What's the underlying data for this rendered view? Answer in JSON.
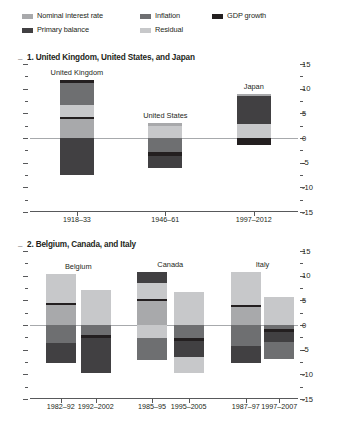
{
  "legend": {
    "items": [
      {
        "label": "Nominal interest rate",
        "color": "#a8a9ab",
        "key": "nominal_interest_rate"
      },
      {
        "label": "Inflation",
        "color": "#6e6f71",
        "key": "inflation"
      },
      {
        "label": "GDP growth",
        "color": "#231f20",
        "key": "gdp_growth"
      },
      {
        "label": "Primary balance",
        "color": "#414042",
        "key": "primary_balance"
      },
      {
        "label": "Residual",
        "color": "#c7c8ca",
        "key": "residual"
      }
    ]
  },
  "chart_data": {
    "type": "bar",
    "subtype": "stacked-bar-waterfall",
    "title": "",
    "ylabel": "",
    "xlabel": "",
    "ylim": [
      -15,
      15
    ],
    "yticks": [
      15,
      10,
      5,
      0,
      -5,
      -10,
      -15
    ],
    "ytick_labels": [
      "15",
      "10",
      "5",
      "0",
      "-5",
      "-10",
      "-15"
    ],
    "minor_tick_step": 2.5,
    "grid": false,
    "legend_position": "top",
    "series_order": [
      "nominal_interest_rate",
      "inflation",
      "gdp_growth",
      "primary_balance",
      "residual"
    ],
    "colors": {
      "nominal_interest_rate": "#a8a9ab",
      "inflation": "#6e6f71",
      "gdp_growth": "#231f20",
      "primary_balance": "#414042",
      "residual": "#c7c8ca"
    },
    "panels": [
      {
        "id": "panel-1",
        "title": "1. United Kingdom, United States, and Japan",
        "bars": [
          {
            "country": "United Kingdom",
            "period": "1918–33",
            "positive_segments": [
              {
                "key": "nominal_interest_rate",
                "value": 3.9
              },
              {
                "key": "gdp_growth",
                "value": 0.4
              },
              {
                "key": "residual",
                "value": 2.4
              },
              {
                "key": "inflation",
                "value": 4.4
              },
              {
                "key": "gdp_growth",
                "value": 0.7
              }
            ],
            "negative_segments": [
              {
                "key": "primary_balance",
                "value": -7.6
              }
            ],
            "total_positive": 11.8,
            "total_negative": -7.6
          },
          {
            "country": "United States",
            "period": "1946–61",
            "positive_segments": [
              {
                "key": "residual",
                "value": 2.4
              },
              {
                "key": "nominal_interest_rate",
                "value": 0.7
              }
            ],
            "negative_segments": [
              {
                "key": "inflation",
                "value": -2.8
              },
              {
                "key": "gdp_growth",
                "value": -0.9
              },
              {
                "key": "primary_balance",
                "value": -2.4
              }
            ],
            "total_positive": 3.1,
            "total_negative": -6.1
          },
          {
            "country": "Japan",
            "period": "1997–2012",
            "positive_segments": [
              {
                "key": "residual",
                "value": 2.9
              },
              {
                "key": "primary_balance",
                "value": 5.7
              },
              {
                "key": "nominal_interest_rate",
                "value": 0.4
              }
            ],
            "negative_segments": [
              {
                "key": "gdp_growth",
                "value": -1.5
              }
            ],
            "total_positive": 9.0,
            "total_negative": -1.5
          }
        ]
      },
      {
        "id": "panel-2",
        "title": "2. Belgium, Canada, and Italy",
        "bars": [
          {
            "country": "Belgium",
            "period": "1982–92",
            "positive_segments": [
              {
                "key": "nominal_interest_rate",
                "value": 4.1
              },
              {
                "key": "gdp_growth",
                "value": 0.4
              },
              {
                "key": "residual",
                "value": 5.8
              }
            ],
            "negative_segments": [
              {
                "key": "inflation",
                "value": -3.6
              },
              {
                "key": "primary_balance",
                "value": -4.1
              }
            ],
            "total_positive": 10.3,
            "total_negative": -7.7
          },
          {
            "country": "Belgium",
            "period": "1992–2002",
            "positive_segments": [
              {
                "key": "residual",
                "value": 7.0
              }
            ],
            "negative_segments": [
              {
                "key": "inflation",
                "value": -2.0
              },
              {
                "key": "gdp_growth",
                "value": -0.6
              },
              {
                "key": "primary_balance",
                "value": -7.1
              }
            ],
            "total_positive": 7.0,
            "total_negative": -9.7
          },
          {
            "country": "Canada",
            "period": "1985–95",
            "positive_segments": [
              {
                "key": "nominal_interest_rate",
                "value": 4.8
              },
              {
                "key": "gdp_growth",
                "value": 0.4
              },
              {
                "key": "residual",
                "value": 3.3
              },
              {
                "key": "primary_balance",
                "value": 2.2
              }
            ],
            "negative_segments": [
              {
                "key": "residual",
                "value": -2.6
              },
              {
                "key": "inflation",
                "value": -4.4
              }
            ],
            "total_positive": 10.7,
            "total_negative": -7.0
          },
          {
            "country": "Canada",
            "period": "1995–2005",
            "positive_segments": [
              {
                "key": "residual",
                "value": 6.7
              }
            ],
            "negative_segments": [
              {
                "key": "inflation",
                "value": -2.7
              },
              {
                "key": "gdp_growth",
                "value": -0.5
              },
              {
                "key": "primary_balance",
                "value": -3.2
              },
              {
                "key": "residual",
                "value": -3.4
              }
            ],
            "total_positive": 6.7,
            "total_negative": -9.8
          },
          {
            "country": "Italy",
            "period": "1987–97",
            "positive_segments": [
              {
                "key": "nominal_interest_rate",
                "value": 3.6
              },
              {
                "key": "gdp_growth",
                "value": 0.4
              },
              {
                "key": "residual",
                "value": 6.8
              }
            ],
            "negative_segments": [
              {
                "key": "inflation",
                "value": -4.3
              },
              {
                "key": "primary_balance",
                "value": -3.4
              }
            ],
            "total_positive": 10.8,
            "total_negative": -7.7
          },
          {
            "country": "Italy",
            "period": "1997–2007",
            "positive_segments": [
              {
                "key": "residual",
                "value": 5.7
              }
            ],
            "negative_segments": [
              {
                "key": "inflation",
                "value": -0.9
              },
              {
                "key": "gdp_growth",
                "value": -0.5
              },
              {
                "key": "primary_balance",
                "value": -2.0
              },
              {
                "key": "inflation",
                "value": -3.5
              }
            ],
            "total_positive": 5.7,
            "total_negative": -6.9
          }
        ]
      }
    ]
  }
}
